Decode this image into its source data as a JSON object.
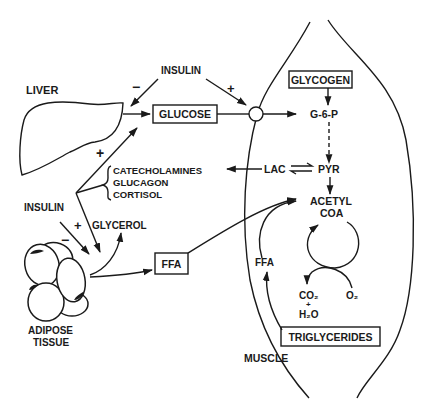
{
  "diagram": {
    "labels": {
      "liver": "LIVER",
      "insulin_top": "INSULIN",
      "insulin_left": "INSULIN",
      "glucose": "GLUCOSE",
      "glycogen": "GLYCOGEN",
      "g6p": "G-6-P",
      "lac": "LAC",
      "pyr": "PYR",
      "acetyl": "ACETYL",
      "coa": "COA",
      "hormones": [
        "CATECHOLAMINES",
        "GLUCAGON",
        "CORTISOL"
      ],
      "glycerol": "GLYCEROL",
      "ffa_box": "FFA",
      "ffa_muscle": "FFA",
      "co2": "CO₂",
      "plus_small": "+",
      "h2o": "H₂O",
      "o2": "O₂",
      "triglycerides": "TRIGLYCERIDES",
      "adipose_line1": "ADIPOSE",
      "adipose_line2": "TISSUE",
      "muscle": "MUSCLE"
    },
    "signs": {
      "insulin_to_liver": "−",
      "insulin_to_muscle": "+",
      "hormones_to_liver": "+",
      "insulin_to_adipose": "−",
      "hormones_to_adipose": "+"
    },
    "colors": {
      "ink": "#1a1a1a",
      "background": "#ffffff"
    }
  }
}
